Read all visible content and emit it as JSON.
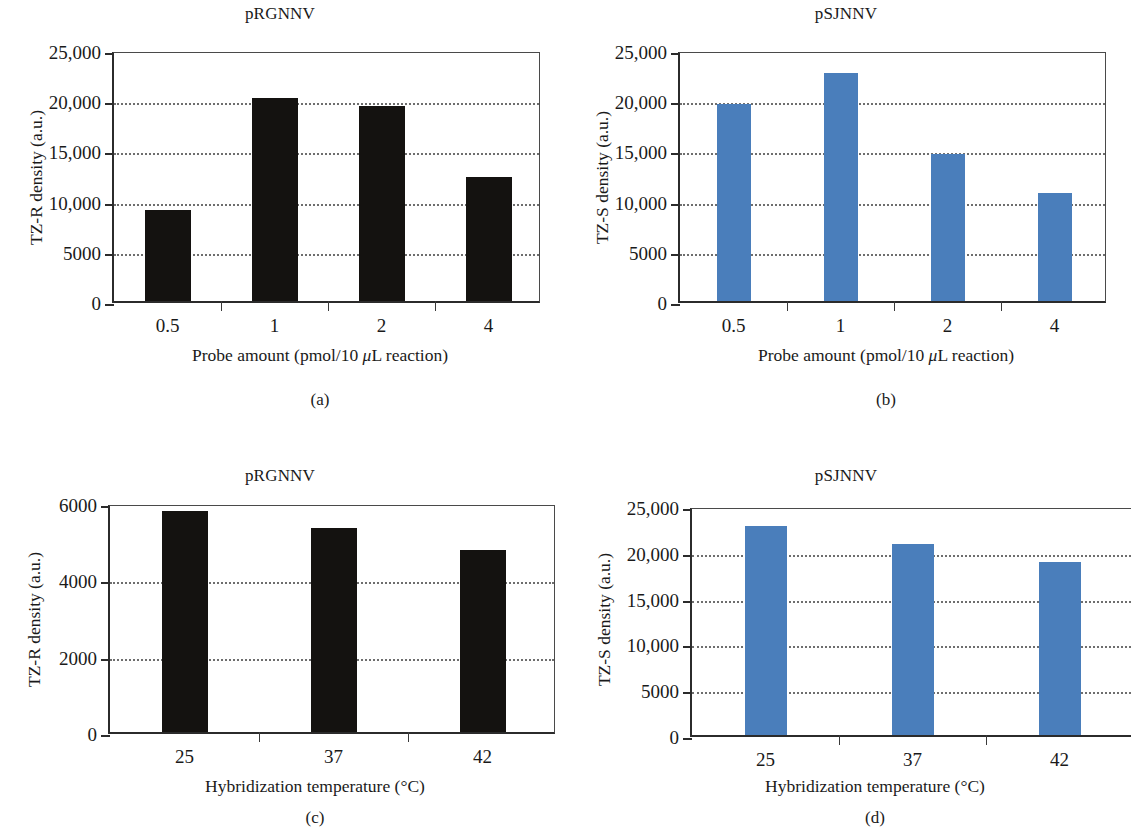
{
  "figure": {
    "panels": [
      {
        "id": "a",
        "caption": "(a)",
        "title": "pRGNNV",
        "ylabel": "TZ-R density (a.u.)",
        "xlabel_html": "Probe amount (pmol/10 <span class=\"mu\">μ</span>L reaction)",
        "xlabel_text": "Probe amount (pmol/10 μL reaction)",
        "bar_color": "#141210",
        "yticks": [
          "0",
          "5000",
          "10,000",
          "15,000",
          "20,000",
          "25,000"
        ],
        "categories": [
          "0.5",
          "1",
          "2",
          "4"
        ],
        "values": [
          9100,
          20200,
          19400,
          12400
        ],
        "ymax": 25000
      },
      {
        "id": "b",
        "caption": "(b)",
        "title": "pSJNNV",
        "ylabel": "TZ-S density (a.u.)",
        "xlabel_html": "Probe amount (pmol/10 <span class=\"mu\">μ</span>L reaction)",
        "xlabel_text": "Probe amount (pmol/10 μL reaction)",
        "bar_color": "#4a7ebb",
        "yticks": [
          "0",
          "5000",
          "10,000",
          "15,000",
          "20,000",
          "25,000"
        ],
        "categories": [
          "0.5",
          "1",
          "2",
          "4"
        ],
        "values": [
          19600,
          22700,
          14600,
          10800
        ],
        "ymax": 25000
      },
      {
        "id": "c",
        "caption": "(c)",
        "title": "pRGNNV",
        "ylabel": "TZ-R density (a.u.)",
        "xlabel_html": "Hybridization temperature (°C)",
        "xlabel_text": "Hybridization temperature (°C)",
        "bar_color": "#141210",
        "yticks": [
          "0",
          "2000",
          "4000",
          "6000"
        ],
        "categories": [
          "25",
          "37",
          "42"
        ],
        "values": [
          5800,
          5350,
          4760
        ],
        "ymax": 6000
      },
      {
        "id": "d",
        "caption": "(d)",
        "title": "pSJNNV",
        "ylabel": "TZ-S density (a.u.)",
        "xlabel_html": "Hybridization temperature (°C)",
        "xlabel_text": "Hybridization temperature (°C)",
        "bar_color": "#4a7ebb",
        "yticks": [
          "0",
          "5000",
          "10,000",
          "15,000",
          "20,000",
          "25,000"
        ],
        "categories": [
          "25",
          "37",
          "42"
        ],
        "values": [
          22800,
          20800,
          18900
        ],
        "ymax": 25000
      }
    ]
  },
  "chart_data": [
    {
      "type": "bar",
      "panel": "a",
      "title": "pRGNNV",
      "categories": [
        "0.5",
        "1",
        "2",
        "4"
      ],
      "values": [
        9100,
        20200,
        19400,
        12400
      ],
      "xlabel": "Probe amount (pmol/10 μL reaction)",
      "ylabel": "TZ-R density (a.u.)",
      "ylim": [
        0,
        25000
      ],
      "yticks": [
        0,
        5000,
        10000,
        15000,
        20000,
        25000
      ],
      "ytick_labels": [
        "0",
        "5000",
        "10,000",
        "15,000",
        "20,000",
        "25,000"
      ],
      "bar_color": "#141210",
      "grid": true,
      "legend": null
    },
    {
      "type": "bar",
      "panel": "b",
      "title": "pSJNNV",
      "categories": [
        "0.5",
        "1",
        "2",
        "4"
      ],
      "values": [
        19600,
        22700,
        14600,
        10800
      ],
      "xlabel": "Probe amount (pmol/10 μL reaction)",
      "ylabel": "TZ-S density (a.u.)",
      "ylim": [
        0,
        25000
      ],
      "yticks": [
        0,
        5000,
        10000,
        15000,
        20000,
        25000
      ],
      "ytick_labels": [
        "0",
        "5000",
        "10,000",
        "15,000",
        "20,000",
        "25,000"
      ],
      "bar_color": "#4a7ebb",
      "grid": true,
      "legend": null
    },
    {
      "type": "bar",
      "panel": "c",
      "title": "pRGNNV",
      "categories": [
        "25",
        "37",
        "42"
      ],
      "values": [
        5800,
        5350,
        4760
      ],
      "xlabel": "Hybridization temperature (°C)",
      "ylabel": "TZ-R density (a.u.)",
      "ylim": [
        0,
        6000
      ],
      "yticks": [
        0,
        2000,
        4000,
        6000
      ],
      "ytick_labels": [
        "0",
        "2000",
        "4000",
        "6000"
      ],
      "bar_color": "#141210",
      "grid": true,
      "legend": null
    },
    {
      "type": "bar",
      "panel": "d",
      "title": "pSJNNV",
      "categories": [
        "25",
        "37",
        "42"
      ],
      "values": [
        22800,
        20800,
        18900
      ],
      "xlabel": "Hybridization temperature (°C)",
      "ylabel": "TZ-S density (a.u.)",
      "ylim": [
        0,
        25000
      ],
      "yticks": [
        0,
        5000,
        10000,
        15000,
        20000,
        25000
      ],
      "ytick_labels": [
        "0",
        "5000",
        "10,000",
        "15,000",
        "20,000",
        "25,000"
      ],
      "bar_color": "#4a7ebb",
      "grid": true,
      "legend": null
    }
  ]
}
